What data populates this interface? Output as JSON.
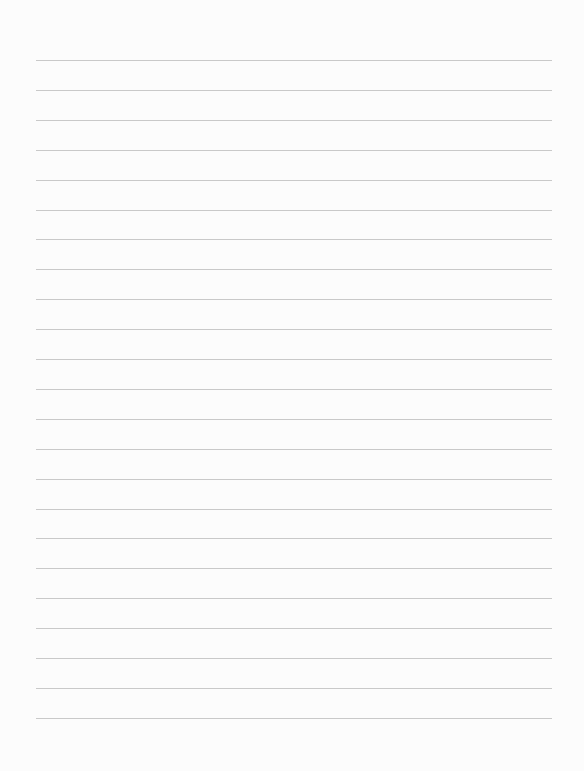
{
  "page": {
    "type": "lined-paper",
    "background_color": "#fcfcfc",
    "line_color": "#c9c9c9",
    "line_count": 23,
    "first_line_y": 60,
    "line_spacing": 29.9,
    "line_left": 36,
    "line_right": 552,
    "text": ""
  }
}
